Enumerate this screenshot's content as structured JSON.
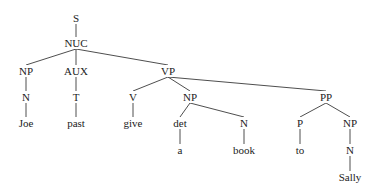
{
  "diagram": {
    "type": "syntax-tree",
    "line_color": "#3a3a3a",
    "text_color": "#1c1c1c",
    "background": "#ffffff",
    "nodes": [
      {
        "id": "S",
        "label": "S",
        "x": 76,
        "y": 18
      },
      {
        "id": "NUC",
        "label": "NUC",
        "x": 76,
        "y": 43
      },
      {
        "id": "NP1",
        "label": "NP",
        "x": 26,
        "y": 71
      },
      {
        "id": "AUX",
        "label": "AUX",
        "x": 76,
        "y": 71
      },
      {
        "id": "VP",
        "label": "VP",
        "x": 168,
        "y": 71
      },
      {
        "id": "N1",
        "label": "N",
        "x": 26,
        "y": 97
      },
      {
        "id": "T",
        "label": "T",
        "x": 76,
        "y": 97
      },
      {
        "id": "V",
        "label": "V",
        "x": 133,
        "y": 97
      },
      {
        "id": "NP2",
        "label": "NP",
        "x": 190,
        "y": 97
      },
      {
        "id": "PP",
        "label": "PP",
        "x": 326,
        "y": 97
      },
      {
        "id": "Joe",
        "label": "Joe",
        "x": 26,
        "y": 123
      },
      {
        "id": "past",
        "label": "past",
        "x": 76,
        "y": 123
      },
      {
        "id": "give",
        "label": "give",
        "x": 133,
        "y": 123
      },
      {
        "id": "det",
        "label": "det",
        "x": 180,
        "y": 123
      },
      {
        "id": "N2",
        "label": "N",
        "x": 244,
        "y": 123
      },
      {
        "id": "P",
        "label": "P",
        "x": 300,
        "y": 123
      },
      {
        "id": "NP3",
        "label": "NP",
        "x": 350,
        "y": 123
      },
      {
        "id": "a",
        "label": "a",
        "x": 180,
        "y": 150
      },
      {
        "id": "book",
        "label": "book",
        "x": 244,
        "y": 150
      },
      {
        "id": "to",
        "label": "to",
        "x": 300,
        "y": 150
      },
      {
        "id": "N3",
        "label": "N",
        "x": 350,
        "y": 150
      },
      {
        "id": "Sally",
        "label": "Sally",
        "x": 350,
        "y": 177
      }
    ],
    "edges": [
      [
        "S",
        "NUC"
      ],
      [
        "NUC",
        "NP1"
      ],
      [
        "NUC",
        "AUX"
      ],
      [
        "NUC",
        "VP"
      ],
      [
        "NP1",
        "N1"
      ],
      [
        "N1",
        "Joe"
      ],
      [
        "AUX",
        "T"
      ],
      [
        "T",
        "past"
      ],
      [
        "VP",
        "V"
      ],
      [
        "VP",
        "NP2"
      ],
      [
        "VP",
        "PP"
      ],
      [
        "V",
        "give"
      ],
      [
        "NP2",
        "det"
      ],
      [
        "NP2",
        "N2"
      ],
      [
        "det",
        "a"
      ],
      [
        "N2",
        "book"
      ],
      [
        "PP",
        "P"
      ],
      [
        "PP",
        "NP3"
      ],
      [
        "P",
        "to"
      ],
      [
        "NP3",
        "N3"
      ],
      [
        "N3",
        "Sally"
      ]
    ]
  }
}
